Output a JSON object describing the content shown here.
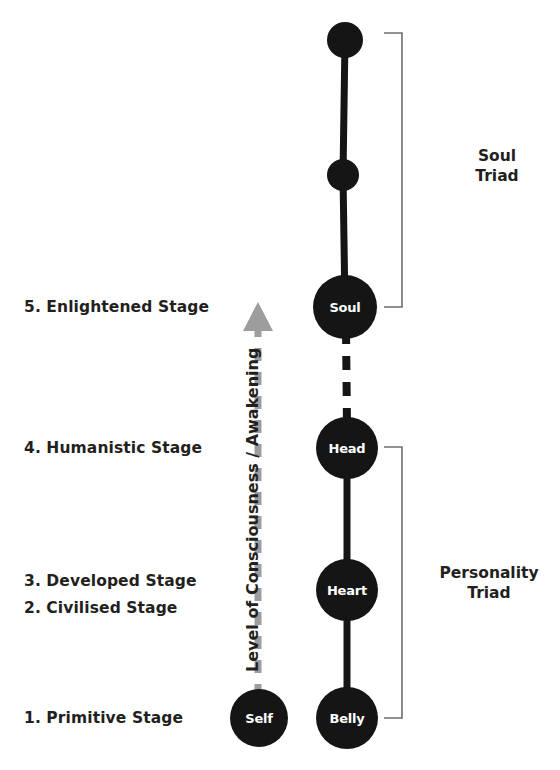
{
  "diagram": {
    "background_color": "#ffffff",
    "node_color": "#151515",
    "node_text_color": "#ffffff",
    "text_color": "#231f20",
    "bracket_color": "#58595b",
    "arrow_color": "#9d9d9d"
  },
  "axis": {
    "label": "Level of Consciousness / Awakening",
    "direction": "up",
    "style": "dashed-arrow",
    "color": "#9d9d9d"
  },
  "stages": [
    {
      "id": "stage-5",
      "label": "5. Enlightened Stage",
      "number": "5",
      "name": "Enlightened Stage",
      "y": 307
    },
    {
      "id": "stage-4",
      "label": "4. Humanistic Stage",
      "number": "4",
      "name": "Humanistic Stage",
      "y": 448
    },
    {
      "id": "stage-3",
      "label": "3. Developed Stage",
      "number": "3",
      "name": "Developed Stage",
      "y": 581
    },
    {
      "id": "stage-2",
      "label": "2. Civilised Stage",
      "number": "2",
      "name": "Civilised Stage",
      "y": 608
    },
    {
      "id": "stage-1",
      "label": "1. Primitive Stage",
      "number": "1",
      "name": "Primitive Stage",
      "y": 718
    }
  ],
  "nodes": [
    {
      "id": "node-monad",
      "label": "",
      "cx": 345,
      "cy": 40,
      "r": 18
    },
    {
      "id": "node-intermediate",
      "label": "",
      "cx": 343,
      "cy": 175,
      "r": 16
    },
    {
      "id": "node-soul",
      "label": "Soul",
      "cx": 345,
      "cy": 307,
      "r": 32
    },
    {
      "id": "node-head",
      "label": "Head",
      "cx": 347,
      "cy": 448,
      "r": 31
    },
    {
      "id": "node-heart",
      "label": "Heart",
      "cx": 347,
      "cy": 590,
      "r": 31
    },
    {
      "id": "node-belly",
      "label": "Belly",
      "cx": 347,
      "cy": 718,
      "r": 31
    },
    {
      "id": "node-self",
      "label": "Self",
      "cx": 259,
      "cy": 718,
      "r": 29
    }
  ],
  "connectors": [
    {
      "id": "connector-monad-intermediate",
      "from": "node-monad",
      "to": "node-intermediate",
      "style": "solid"
    },
    {
      "id": "connector-intermediate-soul",
      "from": "node-intermediate",
      "to": "node-soul",
      "style": "solid"
    },
    {
      "id": "connector-soul-head",
      "from": "node-soul",
      "to": "node-head",
      "style": "dashed"
    },
    {
      "id": "connector-head-heart",
      "from": "node-head",
      "to": "node-heart",
      "style": "solid"
    },
    {
      "id": "connector-heart-belly",
      "from": "node-heart",
      "to": "node-belly",
      "style": "solid"
    }
  ],
  "brackets": [
    {
      "id": "bracket-soul-triad",
      "label": "Soul\nTriad",
      "line1": "Soul",
      "line2": "Triad",
      "top": 33,
      "bottom": 307,
      "label_x": 497,
      "label_y": 166
    },
    {
      "id": "bracket-personality-triad",
      "label": "Personality\nTriad",
      "line1": "Personality",
      "line2": "Triad",
      "top": 447,
      "bottom": 718,
      "label_x": 489,
      "label_y": 583
    }
  ]
}
